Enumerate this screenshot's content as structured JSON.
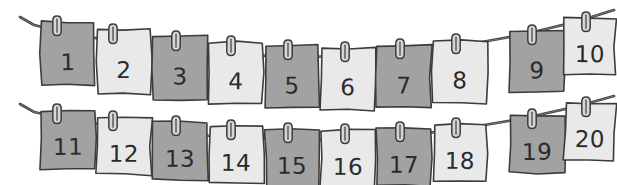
{
  "scene": {
    "title": "Twenty numbered cards pegged on two clotheslines",
    "background_color": "#ffffff",
    "width": 617,
    "height": 185
  },
  "palette": {
    "card_dark": "#a2a2a2",
    "card_light": "#e9e9e9",
    "ink": "#3c3c3c",
    "numeral_ink": "#2b2b2b",
    "peg_fill": "#d6d6d6",
    "string": "#3c3c3c"
  },
  "lines": [
    {
      "name": "top-clothesline",
      "path": "M 20 17 L 34 25 C 120 47, 260 62, 372 55 C 470 49, 560 28, 614 10",
      "card_count": 10
    },
    {
      "name": "bottom-clothesline",
      "path": "M 20 104 L 34 112 C 120 132, 260 144, 372 138 C 470 132, 560 112, 614 96",
      "card_count": 10
    }
  ],
  "cards": [
    {
      "label": "1",
      "shade": "dark",
      "row": "top",
      "x": 41,
      "y": 22,
      "w": 54,
      "h": 63,
      "tilt": -0.6,
      "peg_x": 57,
      "peg_y": 16
    },
    {
      "label": "2",
      "shade": "light",
      "row": "top",
      "x": 97,
      "y": 30,
      "w": 54,
      "h": 63,
      "tilt": 0.5,
      "peg_x": 113,
      "peg_y": 24
    },
    {
      "label": "3",
      "shade": "dark",
      "row": "top",
      "x": 153,
      "y": 37,
      "w": 54,
      "h": 62,
      "tilt": -0.4,
      "peg_x": 176,
      "peg_y": 31
    },
    {
      "label": "4",
      "shade": "light",
      "row": "top",
      "x": 209,
      "y": 42,
      "w": 54,
      "h": 62,
      "tilt": 0.4,
      "peg_x": 231,
      "peg_y": 36
    },
    {
      "label": "5",
      "shade": "dark",
      "row": "top",
      "x": 265,
      "y": 46,
      "w": 54,
      "h": 62,
      "tilt": -0.3,
      "peg_x": 288,
      "peg_y": 40
    },
    {
      "label": "6",
      "shade": "light",
      "row": "top",
      "x": 321,
      "y": 48,
      "w": 54,
      "h": 62,
      "tilt": 0.3,
      "peg_x": 345,
      "peg_y": 42
    },
    {
      "label": "7",
      "shade": "dark",
      "row": "top",
      "x": 377,
      "y": 46,
      "w": 54,
      "h": 62,
      "tilt": -0.4,
      "peg_x": 400,
      "peg_y": 39
    },
    {
      "label": "8",
      "shade": "light",
      "row": "top",
      "x": 433,
      "y": 41,
      "w": 54,
      "h": 62,
      "tilt": 0.5,
      "peg_x": 456,
      "peg_y": 34
    },
    {
      "label": "9",
      "shade": "dark",
      "row": "top",
      "x": 510,
      "y": 31,
      "w": 54,
      "h": 62,
      "tilt": -0.5,
      "peg_x": 532,
      "peg_y": 25
    },
    {
      "label": "10",
      "shade": "light",
      "row": "top",
      "x": 565,
      "y": 18,
      "w": 50,
      "h": 57,
      "tilt": 0.6,
      "peg_x": 586,
      "peg_y": 12
    },
    {
      "label": "11",
      "shade": "dark",
      "row": "bottom",
      "x": 41,
      "y": 110,
      "w": 54,
      "h": 58,
      "tilt": -0.6,
      "peg_x": 57,
      "peg_y": 104
    },
    {
      "label": "12",
      "shade": "light",
      "row": "bottom",
      "x": 97,
      "y": 117,
      "w": 54,
      "h": 58,
      "tilt": 0.5,
      "peg_x": 113,
      "peg_y": 111
    },
    {
      "label": "13",
      "shade": "dark",
      "row": "bottom",
      "x": 153,
      "y": 122,
      "w": 54,
      "h": 58,
      "tilt": -0.4,
      "peg_x": 176,
      "peg_y": 116
    },
    {
      "label": "14",
      "shade": "light",
      "row": "bottom",
      "x": 209,
      "y": 126,
      "w": 54,
      "h": 58,
      "tilt": 0.4,
      "peg_x": 231,
      "peg_y": 120
    },
    {
      "label": "15",
      "shade": "dark",
      "row": "bottom",
      "x": 265,
      "y": 129,
      "w": 54,
      "h": 58,
      "tilt": -0.3,
      "peg_x": 288,
      "peg_y": 123
    },
    {
      "label": "16",
      "shade": "light",
      "row": "bottom",
      "x": 321,
      "y": 130,
      "w": 54,
      "h": 58,
      "tilt": 0.3,
      "peg_x": 345,
      "peg_y": 124
    },
    {
      "label": "17",
      "shade": "dark",
      "row": "bottom",
      "x": 377,
      "y": 128,
      "w": 54,
      "h": 58,
      "tilt": -0.4,
      "peg_x": 400,
      "peg_y": 122
    },
    {
      "label": "18",
      "shade": "light",
      "row": "bottom",
      "x": 433,
      "y": 124,
      "w": 54,
      "h": 58,
      "tilt": 0.5,
      "peg_x": 456,
      "peg_y": 118
    },
    {
      "label": "19",
      "shade": "dark",
      "row": "bottom",
      "x": 510,
      "y": 115,
      "w": 54,
      "h": 58,
      "tilt": -0.5,
      "peg_x": 532,
      "peg_y": 109
    },
    {
      "label": "20",
      "shade": "light",
      "row": "bottom",
      "x": 565,
      "y": 103,
      "w": 50,
      "h": 57,
      "tilt": 0.6,
      "peg_x": 586,
      "peg_y": 97
    }
  ]
}
